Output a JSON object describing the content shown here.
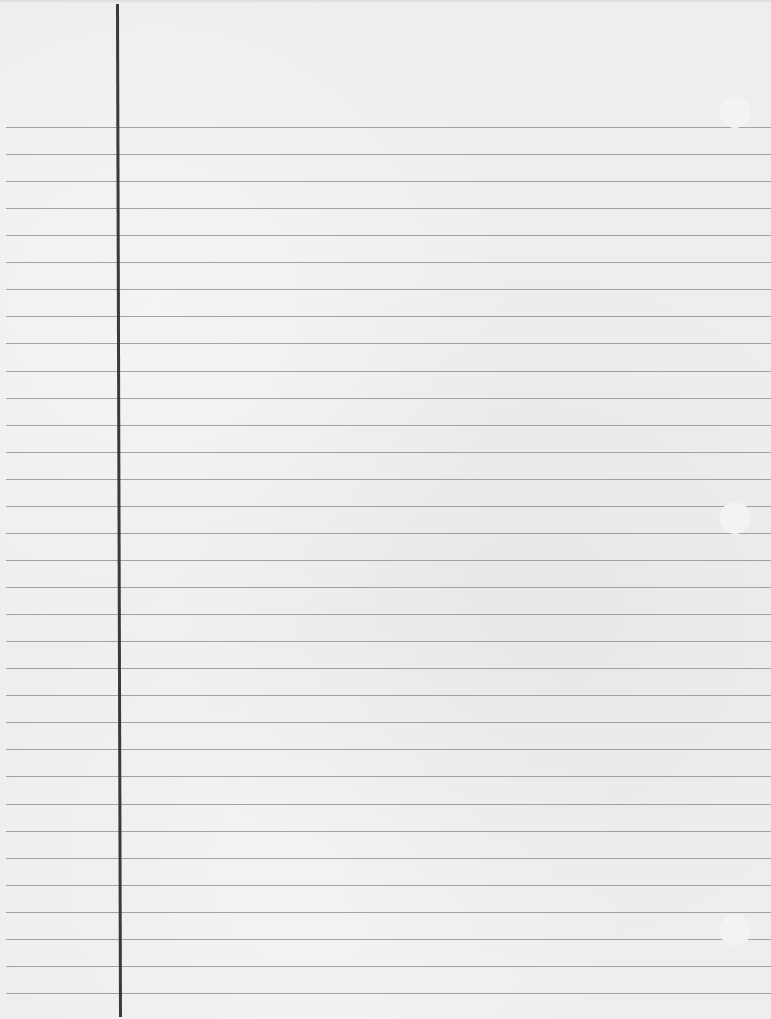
{
  "page": {
    "type": "lined-notebook-paper",
    "content_text": "",
    "colors": {
      "paper": "#eeeeee",
      "rule_line": "#8f8f8f",
      "margin_line": "#3a3a3a",
      "hole": "#f3f3f3"
    },
    "rule_lines": {
      "count": 33,
      "first_y": 127,
      "spacing": 27.06
    },
    "margin_line_x": 120,
    "punch_holes": [
      {
        "cx": 735,
        "cy": 112
      },
      {
        "cx": 735,
        "cy": 518
      },
      {
        "cx": 735,
        "cy": 930
      }
    ]
  }
}
